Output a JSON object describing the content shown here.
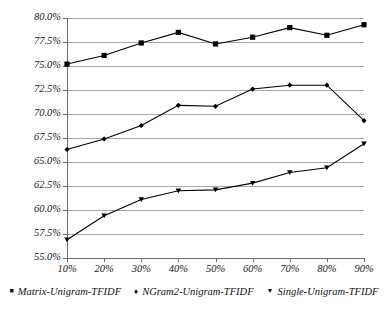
{
  "chart_data": {
    "type": "line",
    "title": "",
    "xlabel": "",
    "ylabel": "",
    "categories": [
      "10%",
      "20%",
      "30%",
      "40%",
      "50%",
      "60%",
      "70%",
      "80%",
      "90%"
    ],
    "x": [
      10,
      20,
      30,
      40,
      50,
      60,
      70,
      80,
      90
    ],
    "ylim": [
      55.0,
      80.0
    ],
    "ytick_step": 2.5,
    "ytick_labels": [
      "55.0%",
      "57.5%",
      "60.0%",
      "62.5%",
      "65.0%",
      "67.5%",
      "70.0%",
      "72.5%",
      "75.0%",
      "77.5%",
      "80.0%"
    ],
    "ytick_values": [
      55.0,
      57.5,
      60.0,
      62.5,
      65.0,
      67.5,
      70.0,
      72.5,
      75.0,
      77.5,
      80.0
    ],
    "grid": true,
    "grid_axis": "y",
    "legend_position": "bottom",
    "series": [
      {
        "name": "Matrix-Unigram-TFIDF",
        "marker": "square",
        "color": "#000000",
        "values": [
          75.2,
          76.1,
          77.4,
          78.5,
          77.3,
          78.0,
          79.0,
          78.2,
          79.3
        ]
      },
      {
        "name": "NGram2-Unigram-TFIDF",
        "marker": "diamond",
        "color": "#000000",
        "values": [
          66.3,
          67.4,
          68.8,
          70.9,
          70.8,
          72.6,
          73.0,
          73.0,
          69.3
        ]
      },
      {
        "name": "Single-Unigram-TFIDF",
        "marker": "triangle-down",
        "color": "#000000",
        "values": [
          56.9,
          59.4,
          61.1,
          62.0,
          62.1,
          62.8,
          63.9,
          64.4,
          66.9
        ]
      }
    ]
  },
  "legend": {
    "items": [
      {
        "label": "Matrix-Unigram-TFIDF",
        "glyph": "■",
        "icon": "square-marker-icon"
      },
      {
        "label": "NGram2-Unigram-TFIDF",
        "glyph": "♦",
        "icon": "diamond-marker-icon"
      },
      {
        "label": "Single-Unigram-TFIDF",
        "glyph": "▼",
        "icon": "triangle-down-marker-icon"
      }
    ]
  },
  "colors": {
    "series": "#000000",
    "gridline": "#a8a8a8",
    "axis": "#6d6d6d",
    "background": "#ffffff",
    "text": "#1a1a1a"
  }
}
